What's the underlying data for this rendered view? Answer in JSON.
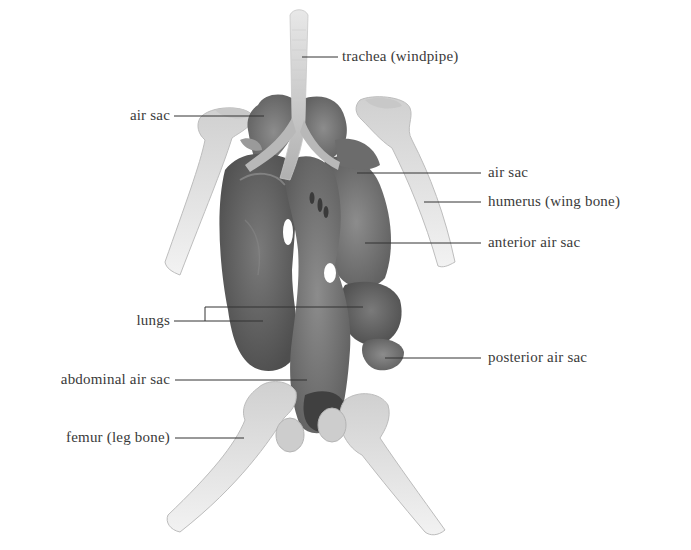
{
  "figure": {
    "colors": {
      "background": "#ffffff",
      "bone": "#d4d4d4",
      "bone_shade": "#b8b8b8",
      "organ_dark": "#5a5a5a",
      "organ_mid": "#6e6e6e",
      "organ_light": "#8a8a8a",
      "leader_line": "#333333",
      "label_text": "#3a3a3a"
    }
  },
  "labels": {
    "trachea": "trachea (windpipe)",
    "air_sac_left": "air sac",
    "air_sac_right": "air sac",
    "humerus": "humerus (wing bone)",
    "anterior_air_sac": "anterior air sac",
    "lungs": "lungs",
    "posterior_air_sac": "posterior air sac",
    "abdominal_air_sac": "abdominal air sac",
    "femur": "femur (leg bone)"
  }
}
